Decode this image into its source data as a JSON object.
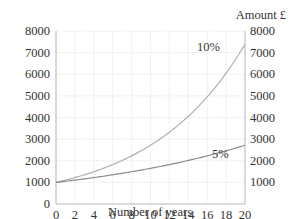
{
  "chart_data": {
    "type": "line",
    "title": "",
    "xlabel": "Number of years",
    "ylabel": "Amount £",
    "xlim": [
      0,
      20
    ],
    "ylim": [
      0,
      8000
    ],
    "x_ticks": [
      0,
      2,
      4,
      6,
      8,
      10,
      12,
      14,
      16,
      18,
      20
    ],
    "y_ticks_left": [
      0,
      1000,
      2000,
      3000,
      4000,
      5000,
      6000,
      7000,
      8000
    ],
    "y_ticks_right": [
      1000,
      2000,
      3000,
      4000,
      5000,
      6000,
      7000,
      8000
    ],
    "grid": true,
    "legend": "inline labels",
    "x": [
      0,
      2,
      4,
      6,
      8,
      10,
      12,
      14,
      16,
      18,
      20
    ],
    "series": [
      {
        "name": "10%",
        "color": "#b0b0b0",
        "values": [
          1000,
          1221,
          1492,
          1822,
          2226,
          2718,
          3320,
          4055,
          4953,
          6050,
          7389
        ]
      },
      {
        "name": "5%",
        "color": "#8a8a8a",
        "values": [
          1000,
          1105,
          1221,
          1350,
          1492,
          1649,
          1822,
          2014,
          2226,
          2460,
          2718
        ]
      }
    ],
    "annotations": [
      {
        "text": "10%",
        "x": 15.5,
        "y": 6900
      },
      {
        "text": "5%",
        "x": 16.3,
        "y": 1500
      }
    ]
  },
  "labels": {
    "x_axis": "Number of years",
    "y_axis_right": "Amount £",
    "series_10": "10%",
    "series_5": "5%"
  }
}
